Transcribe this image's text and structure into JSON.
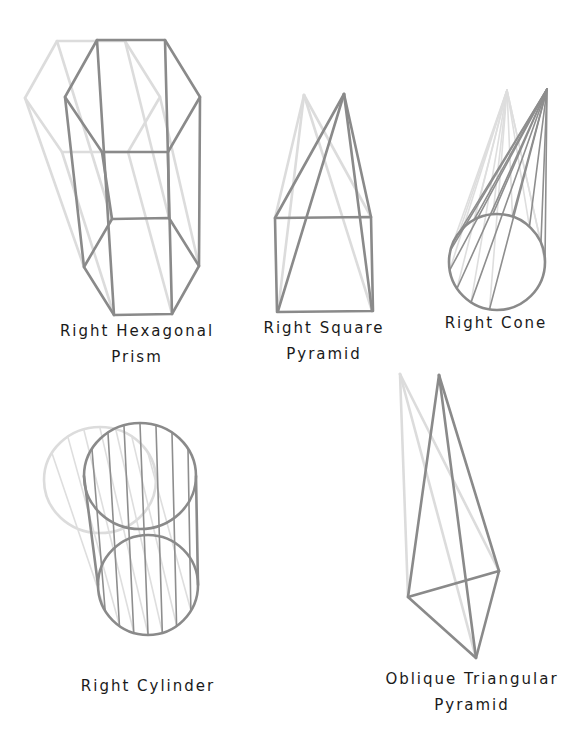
{
  "figure": {
    "colors": {
      "front_outline": "#8a8a8a",
      "ghost_outline": "#dcdcdc",
      "label_text": "#1a1a1a",
      "background": "#ffffff"
    }
  },
  "shapes": [
    {
      "id": "hexagonal-prism",
      "label_lines": [
        "Right Hexagonal",
        "Prism"
      ]
    },
    {
      "id": "square-pyramid",
      "label_lines": [
        "Right Square",
        "Pyramid"
      ]
    },
    {
      "id": "cone",
      "label_lines": [
        "Right Cone"
      ]
    },
    {
      "id": "cylinder",
      "label_lines": [
        "Right Cylinder"
      ]
    },
    {
      "id": "triangular-pyramid",
      "label_lines": [
        "Oblique Triangular",
        "Pyramid"
      ]
    }
  ]
}
